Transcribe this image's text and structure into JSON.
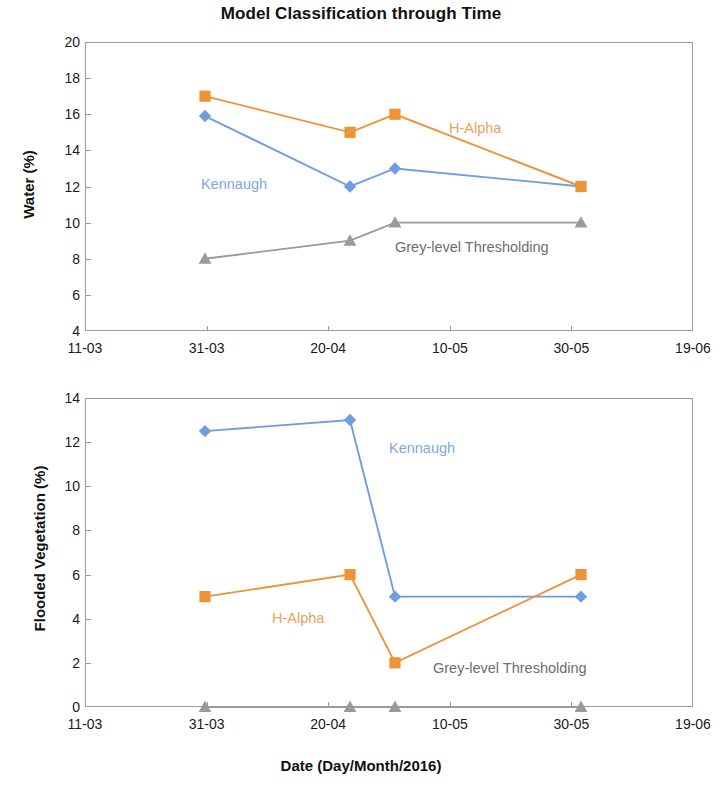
{
  "chart_data": [
    {
      "type": "line",
      "panel": "top",
      "title": "Model Classification through Time",
      "xlabel": "Date (Day/Month/2016)",
      "ylabel": "Water (%)",
      "ylim": [
        4,
        20
      ],
      "yticks": [
        4,
        6,
        8,
        10,
        12,
        14,
        16,
        18,
        20
      ],
      "xticks": [
        "11-03",
        "31-03",
        "20-04",
        "10-05",
        "30-05",
        "19-06"
      ],
      "xlim": [
        "11-03",
        "19-06"
      ],
      "grid": false,
      "legend_position": "inline-annotations",
      "x": [
        "31-03",
        "23-04",
        "30-04",
        "31-05"
      ],
      "series": [
        {
          "name": "Kennaugh",
          "marker": "diamond",
          "color": "#6f9ede",
          "values": [
            15.9,
            12.0,
            13.0,
            12.0
          ],
          "label": "Kennaugh"
        },
        {
          "name": "H-Alpha",
          "marker": "square",
          "color": "#ed9338",
          "values": [
            17.0,
            15.0,
            16.0,
            12.0
          ],
          "label": "H-Alpha"
        },
        {
          "name": "Grey-level Thresholding",
          "marker": "triangle",
          "color": "#9a9a9a",
          "values": [
            8.0,
            9.0,
            10.0,
            10.0
          ],
          "label": "Grey-level Thresholding"
        }
      ]
    },
    {
      "type": "line",
      "panel": "bottom",
      "title": "",
      "xlabel": "Date (Day/Month/2016)",
      "ylabel": "Flooded Vegetation (%)",
      "ylim": [
        0,
        14
      ],
      "yticks": [
        0,
        2,
        4,
        6,
        8,
        10,
        12,
        14
      ],
      "xticks": [
        "11-03",
        "31-03",
        "20-04",
        "10-05",
        "30-05",
        "19-06"
      ],
      "xlim": [
        "11-03",
        "19-06"
      ],
      "grid": false,
      "legend_position": "inline-annotations",
      "x": [
        "31-03",
        "23-04",
        "30-04",
        "31-05"
      ],
      "series": [
        {
          "name": "Kennaugh",
          "marker": "diamond",
          "color": "#6f9ede",
          "values": [
            12.5,
            13.0,
            5.0,
            5.0
          ],
          "label": "Kennaugh"
        },
        {
          "name": "H-Alpha",
          "marker": "square",
          "color": "#ed9338",
          "values": [
            5.0,
            6.0,
            2.0,
            6.0
          ],
          "label": "H-Alpha"
        },
        {
          "name": "Grey-level Thresholding",
          "marker": "triangle",
          "color": "#9a9a9a",
          "values": [
            0.0,
            0.0,
            0.0,
            0.0
          ],
          "label": "Grey-level Thresholding"
        }
      ]
    }
  ],
  "figure": {
    "title": "Model Classification through Time",
    "xaxis_title": "Date (Day/Month/2016)"
  },
  "top": {
    "ylabel": "Water (%)",
    "yticks": [
      "20",
      "18",
      "16",
      "14",
      "12",
      "10",
      "8",
      "6",
      "4"
    ],
    "xticks": [
      "11-03",
      "31-03",
      "20-04",
      "10-05",
      "30-05",
      "19-06"
    ],
    "labels": {
      "kennaugh": "Kennaugh",
      "halpha": "H-Alpha",
      "grey": "Grey-level Thresholding"
    }
  },
  "bottom": {
    "ylabel": "Flooded Vegetation (%)",
    "yticks": [
      "14",
      "12",
      "10",
      "8",
      "6",
      "4",
      "2",
      "0"
    ],
    "xticks": [
      "11-03",
      "31-03",
      "20-04",
      "10-05",
      "30-05",
      "19-06"
    ],
    "labels": {
      "kennaugh": "Kennaugh",
      "halpha": "H-Alpha",
      "grey": "Grey-level Thresholding"
    }
  },
  "colors": {
    "kennaugh": "#6f9ede",
    "halpha": "#ed9338",
    "grey": "#9a9a9a",
    "axis": "#9a9a9a",
    "text": "#111111"
  }
}
